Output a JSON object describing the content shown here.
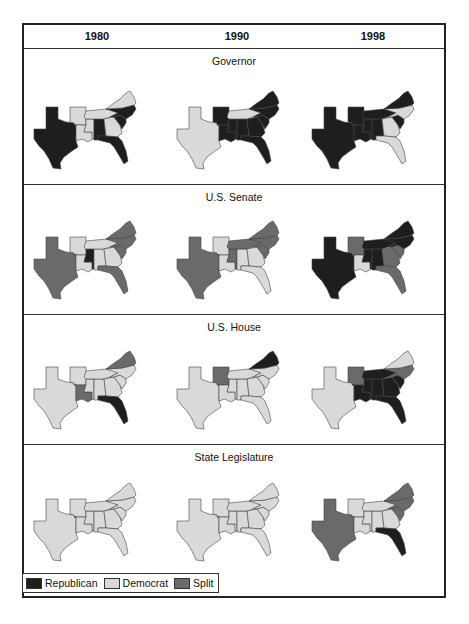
{
  "header": {
    "years": [
      "1980",
      "1990",
      "1998"
    ]
  },
  "colors": {
    "Republican": "#1e1e1e",
    "Democrat": "#d9d9d9",
    "Split": "#6a6a6a",
    "outline": "#444444"
  },
  "legend": [
    {
      "label": "Republican",
      "key": "R"
    },
    {
      "label": "Democrat",
      "key": "D"
    },
    {
      "label": "Split",
      "key": "S"
    }
  ],
  "chart_data": {
    "type": "choropleth-grid",
    "title": "",
    "columns": [
      "1980",
      "1990",
      "1998"
    ],
    "rows": [
      "Governor",
      "U.S. Senate",
      "U.S. House",
      "State Legislature"
    ],
    "states": [
      "TX",
      "AR",
      "LA",
      "MS",
      "AL",
      "TN",
      "GA",
      "FL",
      "SC",
      "NC",
      "VA"
    ],
    "categories": {
      "R": "Republican",
      "D": "Democrat",
      "S": "Split"
    },
    "panels": [
      {
        "title": "Governor",
        "maps": [
          {
            "year": "1980",
            "TX": "R",
            "AR": "D",
            "LA": "D",
            "MS": "D",
            "AL": "R",
            "TN": "D",
            "GA": "D",
            "FL": "R",
            "SC": "R",
            "NC": "R",
            "VA": "D"
          },
          {
            "year": "1990",
            "TX": "D",
            "AR": "R",
            "LA": "R",
            "MS": "R",
            "AL": "R",
            "TN": "D",
            "GA": "R",
            "FL": "R",
            "SC": "R",
            "NC": "R",
            "VA": "R"
          },
          {
            "year": "1998",
            "TX": "R",
            "AR": "R",
            "LA": "R",
            "MS": "R",
            "AL": "R",
            "TN": "R",
            "GA": "D",
            "FL": "D",
            "SC": "R",
            "NC": "D",
            "VA": "R"
          }
        ]
      },
      {
        "title": "U.S. Senate",
        "maps": [
          {
            "year": "1980",
            "TX": "S",
            "AR": "D",
            "LA": "D",
            "MS": "R",
            "AL": "D",
            "TN": "D",
            "GA": "D",
            "FL": "S",
            "SC": "S",
            "NC": "S",
            "VA": "S"
          },
          {
            "year": "1990",
            "TX": "S",
            "AR": "D",
            "LA": "D",
            "MS": "S",
            "AL": "D",
            "TN": "S",
            "GA": "D",
            "FL": "D",
            "SC": "S",
            "NC": "S",
            "VA": "S"
          },
          {
            "year": "1998",
            "TX": "R",
            "AR": "S",
            "LA": "D",
            "MS": "R",
            "AL": "R",
            "TN": "R",
            "GA": "S",
            "FL": "S",
            "SC": "S",
            "NC": "R",
            "VA": "R"
          }
        ]
      },
      {
        "title": "U.S. House",
        "maps": [
          {
            "year": "1980",
            "TX": "D",
            "AR": "D",
            "LA": "S",
            "MS": "D",
            "AL": "D",
            "TN": "D",
            "GA": "D",
            "FL": "R",
            "SC": "D",
            "NC": "D",
            "VA": "S"
          },
          {
            "year": "1990",
            "TX": "D",
            "AR": "S",
            "LA": "D",
            "MS": "D",
            "AL": "D",
            "TN": "D",
            "GA": "D",
            "FL": "D",
            "SC": "D",
            "NC": "D",
            "VA": "R"
          },
          {
            "year": "1998",
            "TX": "D",
            "AR": "S",
            "LA": "R",
            "MS": "R",
            "AL": "R",
            "TN": "R",
            "GA": "R",
            "FL": "R",
            "SC": "R",
            "NC": "S",
            "VA": "D"
          }
        ]
      },
      {
        "title": "State Legislature",
        "maps": [
          {
            "year": "1980",
            "TX": "D",
            "AR": "D",
            "LA": "D",
            "MS": "D",
            "AL": "D",
            "TN": "D",
            "GA": "D",
            "FL": "D",
            "SC": "D",
            "NC": "D",
            "VA": "D"
          },
          {
            "year": "1990",
            "TX": "D",
            "AR": "D",
            "LA": "D",
            "MS": "D",
            "AL": "D",
            "TN": "D",
            "GA": "D",
            "FL": "D",
            "SC": "D",
            "NC": "D",
            "VA": "D"
          },
          {
            "year": "1998",
            "TX": "S",
            "AR": "D",
            "LA": "D",
            "MS": "D",
            "AL": "D",
            "TN": "D",
            "GA": "D",
            "FL": "R",
            "SC": "S",
            "NC": "S",
            "VA": "S"
          }
        ]
      }
    ],
    "legend_position": "bottom-left"
  }
}
